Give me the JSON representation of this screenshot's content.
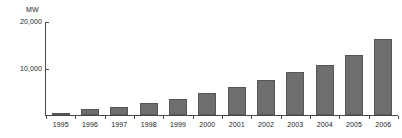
{
  "chart_data": {
    "type": "bar",
    "title": "",
    "subtitle": "",
    "unit_label": "MW",
    "xlabel": "",
    "ylabel": "MW",
    "ylim": [
      0,
      20000
    ],
    "ytick_values": [
      20000,
      10000
    ],
    "ytick_labels": [
      "20,000",
      "10,000"
    ],
    "grid": false,
    "legend": null,
    "categories": [
      "1995",
      "1996",
      "1997",
      "1998",
      "1999",
      "2000",
      "2001",
      "2002",
      "2003",
      "2004",
      "2005",
      "2006"
    ],
    "values": [
      500,
      1200,
      1800,
      2500,
      3500,
      4800,
      6100,
      7600,
      9200,
      10800,
      12800,
      16300
    ],
    "series": [
      {
        "name": "Installed capacity",
        "color": "#6e6e6e",
        "values": [
          500,
          1200,
          1800,
          2500,
          3500,
          4800,
          6100,
          7600,
          9200,
          10800,
          12800,
          16300
        ]
      }
    ],
    "colors": {
      "bar_fill": "#6e6e6e",
      "bar_stroke": "#565656",
      "axis": "#4a4a4a",
      "text": "#1a1a1a",
      "background": "#ffffff"
    }
  }
}
